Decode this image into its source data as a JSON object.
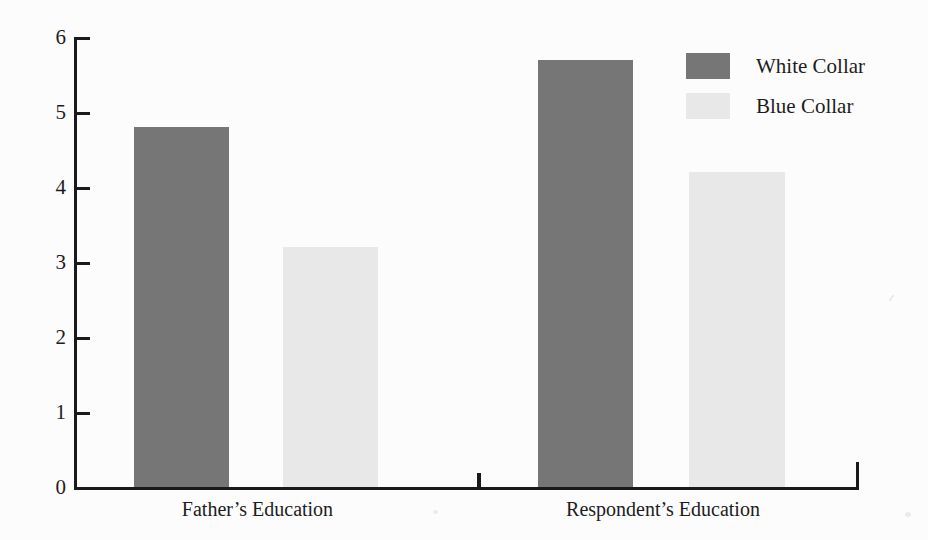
{
  "chart_data": {
    "type": "bar",
    "title": "",
    "xlabel": "",
    "ylabel": "",
    "categories": [
      "Father’s Education",
      "Respondent’s Education"
    ],
    "series": [
      {
        "name": "White Collar",
        "color": "#767676",
        "values": [
          4.8,
          5.7
        ]
      },
      {
        "name": "Blue Collar",
        "color": "#e8e8e8",
        "values": [
          3.2,
          4.2
        ]
      }
    ],
    "ylim": [
      0,
      6
    ],
    "yticks": [
      0,
      1,
      2,
      3,
      4,
      5,
      6
    ],
    "ytick_labels": [
      "0",
      "1",
      "2",
      "3",
      "4",
      "5",
      "6"
    ],
    "grid": false,
    "legend_position": "top-right",
    "background_color": "#fcfcfc",
    "axis_color": "#1a1a1a"
  },
  "legend": {
    "items": [
      {
        "label": "White Collar",
        "swatch": "dark-gray-swatch"
      },
      {
        "label": "Blue Collar",
        "swatch": "light-gray-swatch"
      }
    ]
  },
  "axis": {
    "y_labels": [
      "6",
      "5",
      "4",
      "3",
      "2",
      "1",
      "0"
    ],
    "x_labels": [
      "Father’s Education",
      "Respondent’s Education"
    ]
  }
}
